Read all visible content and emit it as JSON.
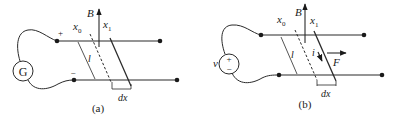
{
  "figure": {
    "panels": [
      {
        "id": "a",
        "caption": "(a)",
        "source_label": "G",
        "plus_sign": "+",
        "minus_sign": "−",
        "field_label": "B",
        "x0_label": "x",
        "x0_sub": "0",
        "x1_label": "x",
        "x1_sub": "1",
        "length_label": "l",
        "dx_label": "dx"
      },
      {
        "id": "b",
        "caption": "(b)",
        "source_label": "v",
        "source_plus": "+",
        "source_minus": "−",
        "field_label": "B",
        "x0_label": "x",
        "x0_sub": "0",
        "x1_label": "x",
        "x1_sub": "1",
        "length_label": "l",
        "current_label": "i",
        "force_label": "F",
        "dx_label": "dx"
      }
    ]
  }
}
